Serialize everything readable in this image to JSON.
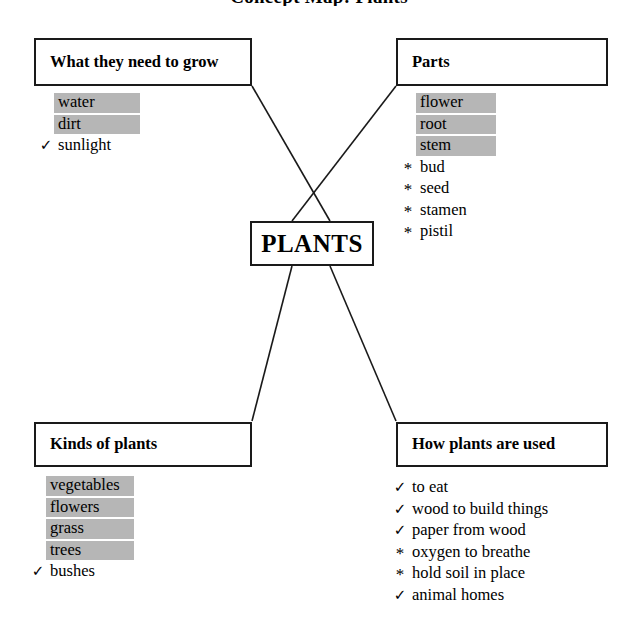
{
  "page": {
    "title": "Concept Map: Plants",
    "center_node": "PLANTS"
  },
  "markers": {
    "check": "✓",
    "star": "*",
    "none": ""
  },
  "nodes": [
    {
      "id": "needs",
      "label": "What they need to grow",
      "items": [
        {
          "marker": "none",
          "text": "water",
          "highlighted": true
        },
        {
          "marker": "none",
          "text": "dirt",
          "highlighted": true
        },
        {
          "marker": "check",
          "text": "sunlight",
          "highlighted": false
        }
      ]
    },
    {
      "id": "parts",
      "label": "Parts",
      "items": [
        {
          "marker": "none",
          "text": "flower",
          "highlighted": true
        },
        {
          "marker": "none",
          "text": "root",
          "highlighted": true
        },
        {
          "marker": "none",
          "text": "stem",
          "highlighted": true
        },
        {
          "marker": "star",
          "text": "bud",
          "highlighted": false
        },
        {
          "marker": "star",
          "text": "seed",
          "highlighted": false
        },
        {
          "marker": "star",
          "text": "stamen",
          "highlighted": false
        },
        {
          "marker": "star",
          "text": "pistil",
          "highlighted": false
        }
      ]
    },
    {
      "id": "kinds",
      "label": "Kinds of plants",
      "items": [
        {
          "marker": "none",
          "text": "vegetables",
          "highlighted": true
        },
        {
          "marker": "none",
          "text": "flowers",
          "highlighted": true
        },
        {
          "marker": "none",
          "text": "grass",
          "highlighted": true
        },
        {
          "marker": "none",
          "text": "trees",
          "highlighted": true
        },
        {
          "marker": "check",
          "text": "bushes",
          "highlighted": false
        }
      ]
    },
    {
      "id": "uses",
      "label": "How plants are used",
      "items": [
        {
          "marker": "check",
          "text": "to eat",
          "highlighted": false
        },
        {
          "marker": "check",
          "text": "wood to build things",
          "highlighted": false
        },
        {
          "marker": "check",
          "text": "paper from wood",
          "highlighted": false
        },
        {
          "marker": "star",
          "text": "oxygen to breathe",
          "highlighted": false
        },
        {
          "marker": "star",
          "text": "hold soil in place",
          "highlighted": false
        },
        {
          "marker": "check",
          "text": "animal homes",
          "highlighted": false
        }
      ]
    }
  ],
  "colors": {
    "line": "#1a1a1a",
    "highlight": "#b6b6b6",
    "background": "#ffffff",
    "text": "#000000"
  }
}
